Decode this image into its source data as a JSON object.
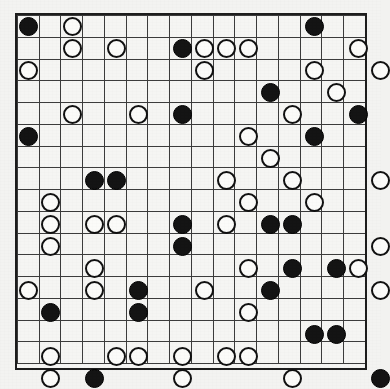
{
  "board": {
    "name": "go-board",
    "type": "grid-of-cells",
    "columns": 16,
    "rows": 16,
    "cell_size_px": 22,
    "origin_x_px": 15,
    "origin_y_px": 13,
    "line_color": "#3a3a3a",
    "border_color": "#1d1d1d",
    "board_fill": "#f5f5f3",
    "page_background": "#f2f2f0",
    "stone_colors": {
      "black": "#141414",
      "white": "#fbfbf9",
      "white_outline": "#111111"
    },
    "stone_diameter_px": 19,
    "counts": {
      "black": 31,
      "white": 52,
      "total": 83
    },
    "stones": [
      {
        "row": 0,
        "col": 0,
        "color": "black"
      },
      {
        "row": 0,
        "col": 2,
        "color": "white"
      },
      {
        "row": 0,
        "col": 13,
        "color": "black"
      },
      {
        "row": 1,
        "col": 2,
        "color": "white"
      },
      {
        "row": 1,
        "col": 4,
        "color": "white"
      },
      {
        "row": 1,
        "col": 7,
        "color": "black"
      },
      {
        "row": 1,
        "col": 8,
        "color": "white"
      },
      {
        "row": 1,
        "col": 9,
        "color": "white"
      },
      {
        "row": 1,
        "col": 10,
        "color": "white"
      },
      {
        "row": 1,
        "col": 15,
        "color": "white"
      },
      {
        "row": 2,
        "col": 0,
        "color": "white"
      },
      {
        "row": 2,
        "col": 8,
        "color": "white"
      },
      {
        "row": 2,
        "col": 13,
        "color": "white"
      },
      {
        "row": 2,
        "col": 16,
        "color": "white"
      },
      {
        "row": 3,
        "col": 11,
        "color": "black"
      },
      {
        "row": 3,
        "col": 14,
        "color": "white"
      },
      {
        "row": 4,
        "col": 2,
        "color": "white"
      },
      {
        "row": 4,
        "col": 5,
        "color": "white"
      },
      {
        "row": 4,
        "col": 7,
        "color": "black"
      },
      {
        "row": 4,
        "col": 12,
        "color": "white"
      },
      {
        "row": 4,
        "col": 15,
        "color": "black"
      },
      {
        "row": 5,
        "col": 0,
        "color": "black"
      },
      {
        "row": 5,
        "col": 10,
        "color": "white"
      },
      {
        "row": 5,
        "col": 13,
        "color": "black"
      },
      {
        "row": 6,
        "col": 11,
        "color": "white"
      },
      {
        "row": 7,
        "col": 3,
        "color": "black"
      },
      {
        "row": 7,
        "col": 4,
        "color": "black"
      },
      {
        "row": 7,
        "col": 9,
        "color": "white"
      },
      {
        "row": 7,
        "col": 12,
        "color": "white"
      },
      {
        "row": 7,
        "col": 16,
        "color": "white"
      },
      {
        "row": 8,
        "col": 1,
        "color": "white"
      },
      {
        "row": 8,
        "col": 10,
        "color": "white"
      },
      {
        "row": 8,
        "col": 13,
        "color": "white"
      },
      {
        "row": 9,
        "col": 1,
        "color": "white"
      },
      {
        "row": 9,
        "col": 3,
        "color": "white"
      },
      {
        "row": 9,
        "col": 4,
        "color": "white"
      },
      {
        "row": 9,
        "col": 7,
        "color": "black"
      },
      {
        "row": 9,
        "col": 9,
        "color": "white"
      },
      {
        "row": 9,
        "col": 11,
        "color": "black"
      },
      {
        "row": 9,
        "col": 12,
        "color": "black"
      },
      {
        "row": 10,
        "col": 1,
        "color": "white"
      },
      {
        "row": 10,
        "col": 7,
        "color": "black"
      },
      {
        "row": 10,
        "col": 16,
        "color": "white"
      },
      {
        "row": 11,
        "col": 3,
        "color": "white"
      },
      {
        "row": 11,
        "col": 10,
        "color": "white"
      },
      {
        "row": 11,
        "col": 12,
        "color": "black"
      },
      {
        "row": 11,
        "col": 14,
        "color": "black"
      },
      {
        "row": 11,
        "col": 15,
        "color": "white"
      },
      {
        "row": 12,
        "col": 0,
        "color": "white"
      },
      {
        "row": 12,
        "col": 3,
        "color": "white"
      },
      {
        "row": 12,
        "col": 5,
        "color": "black"
      },
      {
        "row": 12,
        "col": 8,
        "color": "white"
      },
      {
        "row": 12,
        "col": 11,
        "color": "black"
      },
      {
        "row": 12,
        "col": 16,
        "color": "white"
      },
      {
        "row": 13,
        "col": 1,
        "color": "black"
      },
      {
        "row": 13,
        "col": 5,
        "color": "black"
      },
      {
        "row": 13,
        "col": 10,
        "color": "white"
      },
      {
        "row": 14,
        "col": 13,
        "color": "black"
      },
      {
        "row": 14,
        "col": 14,
        "color": "black"
      },
      {
        "row": 15,
        "col": 1,
        "color": "white"
      },
      {
        "row": 15,
        "col": 4,
        "color": "white"
      },
      {
        "row": 15,
        "col": 5,
        "color": "white"
      },
      {
        "row": 15,
        "col": 7,
        "color": "white"
      },
      {
        "row": 15,
        "col": 9,
        "color": "white"
      },
      {
        "row": 15,
        "col": 10,
        "color": "white"
      },
      {
        "row": 16,
        "col": 1,
        "color": "white"
      },
      {
        "row": 16,
        "col": 3,
        "color": "black"
      },
      {
        "row": 16,
        "col": 7,
        "color": "white"
      },
      {
        "row": 16,
        "col": 12,
        "color": "white"
      },
      {
        "row": 16,
        "col": 16,
        "color": "black"
      }
    ]
  }
}
